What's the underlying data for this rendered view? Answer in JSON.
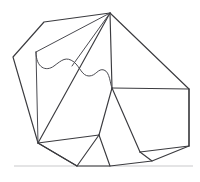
{
  "figure": {
    "type": "line-diagram",
    "canvas": {
      "width": 200,
      "height": 182
    },
    "colors": {
      "background": "#ffffff",
      "stroke_dark": "#3b3b3f",
      "stroke_medium": "#4a4a50",
      "ground": "#c9c9cc",
      "face_fill": "#ffffff"
    },
    "ground": {
      "label": "ground-line",
      "y": 166,
      "x_start": 14,
      "x_end": 193,
      "color": "#c9c9cc"
    },
    "vertices": {
      "apex": [
        110,
        13
      ],
      "upper_left_bend": [
        44,
        22
      ],
      "left": [
        13,
        57
      ],
      "lower_left_hub": [
        38,
        143
      ],
      "inner_left_top": [
        36,
        52
      ],
      "curve_end_right": [
        112,
        88
      ],
      "rect_top_right": [
        189,
        89
      ],
      "rect_bottom_right": [
        189,
        146
      ],
      "mid_junction": [
        99,
        135
      ],
      "bottom_mid": [
        77,
        166
      ],
      "bottom_center": [
        110,
        166
      ],
      "bottom_right_foot": [
        152,
        161
      ],
      "lower_right_node": [
        140,
        152
      ]
    },
    "paths": {
      "outer_polygon": "M 13 57 L 44 22 L 110 13 L 189 89 L 189 146 L 152 161 L 110 166 L 77 166 L 38 143 Z",
      "apex_to_hub": "M 110 13 L 38 143",
      "apex_to_inner_left": "M 110 13 L 36 52",
      "apex_to_curve_end": "M 110 13 L 112 88",
      "apex_fan_mid": "M 110 13 L 72 66",
      "inner_left_vertical": "M 36 52 L 38 143",
      "rect_top_edge": "M 112 88 L 189 89",
      "rect_right_edge": "M 189 89 L 189 146",
      "rect_diag_to_foot": "M 189 146 L 140 152",
      "curve_end_to_junction": "M 112 88 L 99 135",
      "curve_end_to_lower_right": "M 112 88 L 140 152",
      "hub_to_junction": "M 38 143 L 99 135",
      "junction_to_bottom_mid": "M 99 135 L 77 166",
      "junction_to_bottom_center": "M 99 135 L 110 166",
      "lower_right_to_foot": "M 140 152 L 152 161",
      "hub_to_bottom_mid": "M 38 143 L 77 166",
      "wave": "M 36 52 C 36 68, 46 72, 54 66 C 62 60, 66 56, 74 62 C 80 67, 82 76, 89 76 C 96 76, 98 68, 104 70 C 110 72, 110 84, 112 88"
    },
    "elements": [
      {
        "name": "outer-silhouette",
        "description": "Outer nine-sided polygon silhouette"
      },
      {
        "name": "apex-fan",
        "description": "Fan of edges radiating from the top apex vertex"
      },
      {
        "name": "left-panel",
        "description": "Tall narrow left facet bounded by inner vertical line"
      },
      {
        "name": "wave-contour",
        "description": "Wavy S-curve contour crossing the upper facet"
      },
      {
        "name": "right-rectangle-facet",
        "description": "Quadrilateral facet on the right side"
      },
      {
        "name": "lower-center-facet",
        "description": "Pentagonal facet at lower center"
      },
      {
        "name": "ground-line",
        "description": "Light gray horizontal ground line"
      }
    ]
  }
}
